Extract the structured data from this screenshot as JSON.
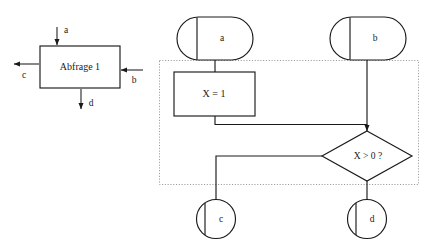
{
  "figure": {
    "type": "flowchart",
    "background_color": "#ffffff",
    "line_color": "#1a1a1a",
    "region_border_color": "#9a9a9a"
  },
  "black_box_view": {
    "process_box": {
      "label": "Abfrage 1",
      "x": 40,
      "y": 46,
      "width": 80,
      "height": 42
    },
    "ports": [
      {
        "name": "a",
        "label": "a",
        "direction": "in",
        "side": "top"
      },
      {
        "name": "b",
        "label": "b",
        "direction": "in",
        "side": "right"
      },
      {
        "name": "c",
        "label": "c",
        "direction": "out",
        "side": "left"
      },
      {
        "name": "d",
        "label": "d",
        "direction": "out",
        "side": "bottom"
      }
    ]
  },
  "flowchart_view": {
    "terminals_top": [
      {
        "name": "a",
        "label": "a",
        "shape": "stadium"
      },
      {
        "name": "b",
        "label": "b",
        "shape": "stadium"
      }
    ],
    "process": {
      "label": "X = 1",
      "shape": "rectangle"
    },
    "decision": {
      "label": "X > 0 ?",
      "shape": "diamond"
    },
    "terminals_bottom": [
      {
        "name": "c",
        "label": "c",
        "shape": "circle"
      },
      {
        "name": "d",
        "label": "d",
        "shape": "circle"
      }
    ],
    "module_region": {
      "label": "",
      "border_style": "dotted"
    }
  }
}
